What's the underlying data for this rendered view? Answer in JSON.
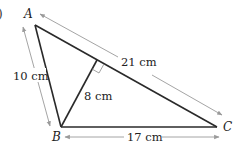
{
  "figure": {
    "part_label": ")",
    "vertices": {
      "A": {
        "label": "A"
      },
      "B": {
        "label": "B"
      },
      "C": {
        "label": "C"
      }
    },
    "measurements": {
      "AB": "10 cm",
      "AC": "21 cm",
      "BC": "17 cm",
      "altitude": "8 cm"
    },
    "colors": {
      "edge": "#2a2a2a",
      "dimension_arrow": "#9a9a9a"
    }
  }
}
